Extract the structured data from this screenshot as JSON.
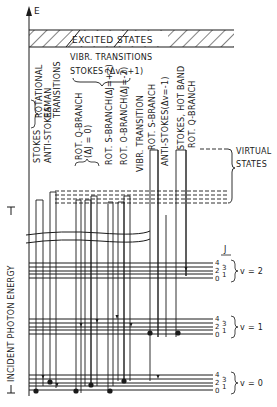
{
  "diagram": {
    "axis": {
      "label": "E",
      "incident_label": "INCIDENT PHOTON ENERGY"
    },
    "excited_band": {
      "label": "EXCITED STATES"
    },
    "virtual_states": {
      "label_line1": "VIRTUAL",
      "label_line2": "STATES"
    },
    "headers": {
      "rotational_group": [
        "ROTATIONAL",
        "RAMAN",
        "TRANSITIONS"
      ],
      "vibr_group_line1": "VIBR. TRANSITIONS",
      "vibr_group_line2": "STOKES (Δv=+1)"
    },
    "transition_labels": [
      {
        "id": "stokes",
        "text": "STOKES"
      },
      {
        "id": "anti-stokes",
        "text": "ANTI-STOKES"
      },
      {
        "id": "rot-q-branch",
        "text": "ROT. Q-BRANCH"
      },
      {
        "id": "rot-q-branch-dj",
        "text": "(ΔJ = 0)"
      },
      {
        "id": "rot-s-branch",
        "text": "ROT. S-BRANCH(ΔJ=+2)"
      },
      {
        "id": "rot-o-branch",
        "text": "ROT. O-BRANCH(ΔJ=-2)"
      },
      {
        "id": "vibr-transition",
        "text": "VIBR. TRANSITION"
      },
      {
        "id": "rot-s-branch-2",
        "text": "ROT. S-BRANCH"
      },
      {
        "id": "anti-stokes-dv",
        "text": "ANTI-STOKES(Δv=-1)"
      },
      {
        "id": "stokes-hot-band",
        "text": "STOKES, HOT BAND"
      },
      {
        "id": "rot-q-branch-2",
        "text": "ROT. Q-BRANCH"
      }
    ],
    "j_label": "J",
    "vib_levels": [
      {
        "label": "v = 2",
        "j_labels": [
          "4",
          "3",
          "2",
          "1",
          "0"
        ]
      },
      {
        "label": "v = 1",
        "j_labels": [
          "4",
          "3",
          "2",
          "1",
          "0"
        ]
      },
      {
        "label": "v = 0",
        "j_labels": [
          "4",
          "3",
          "2",
          "1",
          "0"
        ]
      }
    ],
    "colors": {
      "ink": "#1a1a1a",
      "background": "#ffffff"
    }
  }
}
